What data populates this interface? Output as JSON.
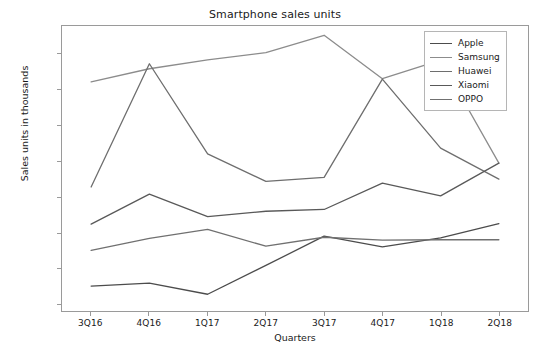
{
  "chart_data": {
    "type": "line",
    "title": "Smartphone sales units",
    "xlabel": "Quarters",
    "ylabel": "Sales units in thousands",
    "categories": [
      "3Q16",
      "4Q16",
      "1Q17",
      "2Q17",
      "3Q17",
      "4Q17",
      "1Q18",
      "2Q18"
    ],
    "ylim": [
      8000,
      88000
    ],
    "yticks": [
      10000,
      20000,
      30000,
      40000,
      50000,
      60000,
      70000,
      80000
    ],
    "ytick_labels": [
      "10000",
      "20000",
      "30000",
      "40000",
      "50000",
      "60000",
      "70000",
      "80000"
    ],
    "grid": false,
    "legend_position": "upper right",
    "series": [
      {
        "name": "Apple",
        "color": "#4c4c4c",
        "values": [
          15000,
          15800,
          12700,
          20800,
          29000,
          26000,
          28500,
          32500
        ]
      },
      {
        "name": "Samsung",
        "color": "#8c8c8c",
        "values": [
          72300,
          76000,
          78500,
          80500,
          85400,
          73200,
          78400,
          49500
        ]
      },
      {
        "name": "Huawei",
        "color": "#6e6e6e",
        "values": [
          42800,
          77400,
          52100,
          44400,
          45500,
          73100,
          53700,
          45000
        ]
      },
      {
        "name": "Xiaomi",
        "color": "#595959",
        "values": [
          32400,
          40800,
          34500,
          36000,
          36500,
          43900,
          40300,
          49500
        ]
      },
      {
        "name": "OPPO",
        "color": "#707070",
        "values": [
          25000,
          28400,
          30900,
          26200,
          28700,
          27900,
          28000,
          28000
        ]
      }
    ]
  },
  "legend": {
    "items": [
      {
        "label": "Apple"
      },
      {
        "label": "Samsung"
      },
      {
        "label": "Huawei"
      },
      {
        "label": "Xiaomi"
      },
      {
        "label": "OPPO"
      }
    ]
  }
}
